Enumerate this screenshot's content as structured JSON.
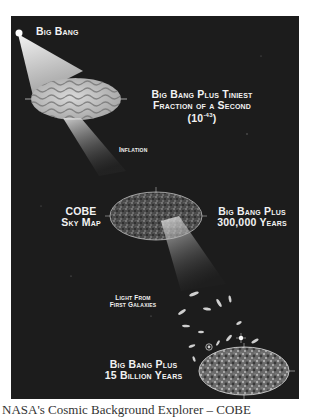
{
  "diagram": {
    "labels": {
      "big_bang": "Big Bang",
      "tiniest_fraction_line1": "Big Bang Plus Tiniest",
      "tiniest_fraction_line2": "Fraction of a Second",
      "tiniest_fraction_base": "(10",
      "tiniest_fraction_exp": "-43",
      "tiniest_fraction_close": ")",
      "inflation": "Inflation",
      "cobe_line1": "COBE",
      "cobe_line2": "Sky Map",
      "years300k_line1": "Big Bang Plus",
      "years300k_line2": "300,000 Years",
      "light_line1": "Light From",
      "light_line2": "First Galaxies",
      "billion_line1": "Big Bang Plus",
      "billion_line2": "15 Billion Years"
    },
    "colors": {
      "background": "#1c1c1c",
      "text": "#f2f2f2",
      "beam": "#d8d8d8"
    }
  },
  "caption": "NASA's Cosmic Background Explorer – COBE"
}
